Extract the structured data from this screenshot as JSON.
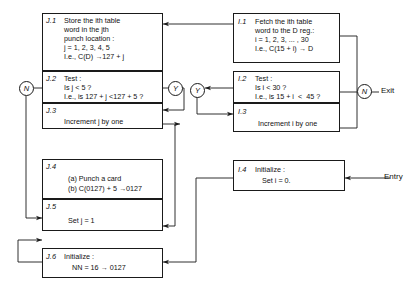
{
  "diagram": {
    "type": "flowchart",
    "stroke_color": "#1a1a1a",
    "background": "#ffffff"
  },
  "boxes": {
    "j1": {
      "tag": "J.1",
      "lines": [
        "Store the ith table",
        "word in the jth",
        "punch location :",
        "j = 1, 2, 3, 4, 5",
        "I.e., C(D) →127 + j"
      ]
    },
    "j2": {
      "tag": "J.2",
      "lines": [
        "Test :",
        "Is j < 5 ?",
        "I.e., is 127 + j <127 + 5 ?"
      ]
    },
    "j3": {
      "tag": "J.3",
      "lines": [
        "Increment j by one"
      ]
    },
    "j4": {
      "tag": "J.4",
      "lines": [
        "(a) Punch a card",
        "(b) C(0127) + 5 →0127"
      ]
    },
    "j5": {
      "tag": "J.5",
      "lines": [
        "Set j = 1"
      ]
    },
    "j6": {
      "tag": "J.6",
      "lines": [
        "Initialize :",
        "NN = 16 → 0127"
      ]
    },
    "i1": {
      "tag": "I.1",
      "lines": [
        "Fetch the ith table",
        "word to the D reg.:",
        "i = 1, 2, 3, ... , 30",
        "I.e., C(15 + i) → D"
      ]
    },
    "i2": {
      "tag": "I.2",
      "lines": [
        "Test :",
        "Is i < 30 ?",
        "I.e., is 15 + i  <  45 ?"
      ]
    },
    "i3": {
      "tag": "I.3",
      "lines": [
        "Increment i by one"
      ]
    },
    "i4": {
      "tag": "I.4",
      "lines": [
        "Initialize :",
        "Set i = 0."
      ]
    }
  },
  "nodes": {
    "n_left": "N",
    "y_left": "Y",
    "y_right": "Y",
    "n_right": "N"
  },
  "terminals": {
    "exit": "Exit",
    "entry": "Entry"
  }
}
